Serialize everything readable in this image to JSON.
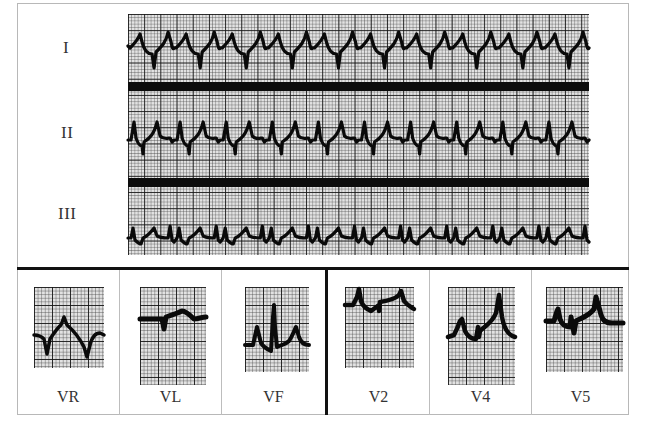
{
  "figure": {
    "type": "12-lead ECG excerpt (limb + precordial leads)",
    "limb_rhythm_strip": {
      "leads": [
        {
          "label": "I",
          "beats_visible": 10
        },
        {
          "label": "II",
          "beats_visible": 10
        },
        {
          "label": "III",
          "beats_visible": 10
        }
      ]
    },
    "lead_panels": {
      "group_left": [
        {
          "label": "VR"
        },
        {
          "label": "VL"
        },
        {
          "label": "VF"
        }
      ],
      "group_right": [
        {
          "label": "V2"
        },
        {
          "label": "V4"
        },
        {
          "label": "V5"
        }
      ]
    },
    "colors": {
      "grid_background": "#e2e2e2",
      "grid_major": "#141414",
      "trace": "#0a0a0a",
      "separator_bar": "#0c0c0c",
      "frame_border": "#b8b8b8"
    }
  }
}
